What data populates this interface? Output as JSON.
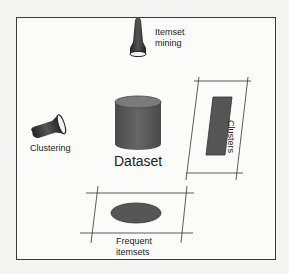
{
  "diagram": {
    "center": {
      "label": "Dataset",
      "shape": "cylinder",
      "color": "#555555"
    },
    "nodes": [
      {
        "id": "itemset-mining",
        "label_line1": "Itemset",
        "label_line2": "mining",
        "icon": "flashlight-icon"
      },
      {
        "id": "clustering",
        "label": "Clustering",
        "icon": "flashlight-icon"
      },
      {
        "id": "clusters",
        "label": "Clusters",
        "shape": "rectangle-in-parallelogram"
      },
      {
        "id": "frequent-itemsets",
        "label_line1": "Frequent",
        "label_line2": "itemsets",
        "shape": "ellipse-in-parallelogram"
      }
    ],
    "colors": {
      "shape_fill": "#555555",
      "stroke": "#333333",
      "background": "#fbfbfa"
    }
  }
}
